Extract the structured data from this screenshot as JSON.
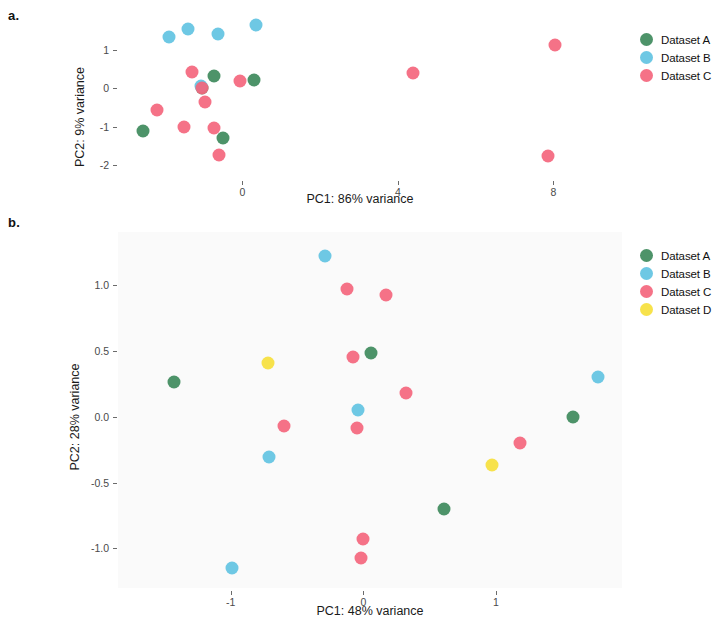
{
  "figure": {
    "panel_a_letter": "a.",
    "panel_b_letter": "b."
  },
  "panel_a": {
    "xlabel": "PC1: 86% variance",
    "ylabel": "PC2: 9% variance",
    "x_ticks": [
      "0",
      "4",
      "8"
    ],
    "y_ticks": [
      "1",
      "0",
      "-1",
      "-2"
    ],
    "legend": [
      {
        "label": "Dataset A",
        "color": "#3e8a5c"
      },
      {
        "label": "Dataset B",
        "color": "#62c3e2"
      },
      {
        "label": "Dataset C",
        "color": "#f4667d"
      }
    ]
  },
  "panel_b": {
    "xlabel": "PC1: 48% variance",
    "ylabel": "PC2: 28% variance",
    "x_ticks": [
      "-1",
      "0",
      "1"
    ],
    "y_ticks": [
      "1.0",
      "0.5",
      "0.0",
      "-0.5",
      "-1.0"
    ],
    "legend": [
      {
        "label": "Dataset A",
        "color": "#3e8a5c"
      },
      {
        "label": "Dataset B",
        "color": "#62c3e2"
      },
      {
        "label": "Dataset C",
        "color": "#f4667d"
      },
      {
        "label": "Dataset D",
        "color": "#f6e03c"
      }
    ]
  },
  "chart_data": [
    {
      "type": "scatter",
      "panel": "a",
      "title": "",
      "xlabel": "PC1: 86% variance",
      "ylabel": "PC2: 9% variance",
      "xlim": [
        -3.2,
        9.2
      ],
      "ylim": [
        -2.35,
        1.95
      ],
      "xticks": [
        0,
        4,
        8
      ],
      "yticks": [
        1,
        0,
        -1,
        -2
      ],
      "grid": false,
      "legend_position": "right",
      "series": [
        {
          "name": "Dataset A",
          "color": "#3e8a5c",
          "points": [
            {
              "x": -2.55,
              "y": -1.12
            },
            {
              "x": -0.72,
              "y": 0.32
            },
            {
              "x": -0.5,
              "y": -1.3
            },
            {
              "x": 0.3,
              "y": 0.22
            },
            {
              "x": -1.05,
              "y": 0.02
            }
          ]
        },
        {
          "name": "Dataset B",
          "color": "#62c3e2",
          "points": [
            {
              "x": -1.9,
              "y": 1.35
            },
            {
              "x": -1.4,
              "y": 1.55
            },
            {
              "x": -0.62,
              "y": 1.42
            },
            {
              "x": 0.35,
              "y": 1.67
            },
            {
              "x": -1.07,
              "y": 0.05
            }
          ]
        },
        {
          "name": "Dataset C",
          "color": "#f4667d",
          "points": [
            {
              "x": -1.3,
              "y": 0.43
            },
            {
              "x": -2.2,
              "y": -0.58
            },
            {
              "x": -1.05,
              "y": 0.02
            },
            {
              "x": -0.95,
              "y": -0.35
            },
            {
              "x": -1.5,
              "y": -1.02
            },
            {
              "x": -0.72,
              "y": -1.03
            },
            {
              "x": -0.6,
              "y": -1.75
            },
            {
              "x": -0.05,
              "y": 0.2
            },
            {
              "x": 4.4,
              "y": 0.4
            },
            {
              "x": 8.05,
              "y": 1.15
            },
            {
              "x": 7.85,
              "y": -1.78
            }
          ]
        }
      ]
    },
    {
      "type": "scatter",
      "panel": "b",
      "title": "",
      "xlabel": "PC1: 48% variance",
      "ylabel": "PC2: 28% variance",
      "xlim": [
        -1.85,
        1.95
      ],
      "ylim": [
        -1.3,
        1.4
      ],
      "xticks": [
        -1,
        0,
        1
      ],
      "yticks": [
        1.0,
        0.5,
        0.0,
        -0.5,
        -1.0
      ],
      "grid": false,
      "legend_position": "right",
      "series": [
        {
          "name": "Dataset A",
          "color": "#3e8a5c",
          "points": [
            {
              "x": -1.43,
              "y": 0.26
            },
            {
              "x": 0.06,
              "y": 0.48
            },
            {
              "x": 1.58,
              "y": 0.0
            },
            {
              "x": 0.61,
              "y": -0.7
            }
          ]
        },
        {
          "name": "Dataset B",
          "color": "#62c3e2",
          "points": [
            {
              "x": -0.29,
              "y": 1.22
            },
            {
              "x": -0.71,
              "y": -0.31
            },
            {
              "x": -0.04,
              "y": 0.05
            },
            {
              "x": 1.77,
              "y": 0.3
            },
            {
              "x": -0.99,
              "y": -1.15
            }
          ]
        },
        {
          "name": "Dataset C",
          "color": "#f4667d",
          "points": [
            {
              "x": -0.12,
              "y": 0.97
            },
            {
              "x": 0.17,
              "y": 0.92
            },
            {
              "x": -0.08,
              "y": 0.45
            },
            {
              "x": 0.32,
              "y": 0.18
            },
            {
              "x": -0.6,
              "y": -0.07
            },
            {
              "x": -0.05,
              "y": -0.09
            },
            {
              "x": 1.18,
              "y": -0.2
            },
            {
              "x": 0.0,
              "y": -0.93
            },
            {
              "x": -0.02,
              "y": -1.07
            }
          ]
        },
        {
          "name": "Dataset D",
          "color": "#f6e03c",
          "points": [
            {
              "x": -0.72,
              "y": 0.41
            },
            {
              "x": 0.97,
              "y": -0.37
            }
          ]
        }
      ]
    }
  ]
}
